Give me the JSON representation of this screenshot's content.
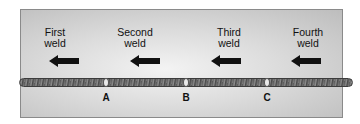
{
  "welds": [
    {
      "label_line1": "First",
      "label_line2": "weld"
    },
    {
      "label_line1": "Second",
      "label_line2": "weld"
    },
    {
      "label_line1": "Third",
      "label_line2": "weld"
    },
    {
      "label_line1": "Fourth",
      "label_line2": "weld"
    }
  ],
  "arrow_direction": "left",
  "points": [
    "A",
    "B",
    "C"
  ],
  "colors": {
    "arrow": "#111111",
    "bead": "#555555",
    "panel": "#d6d6d6"
  }
}
